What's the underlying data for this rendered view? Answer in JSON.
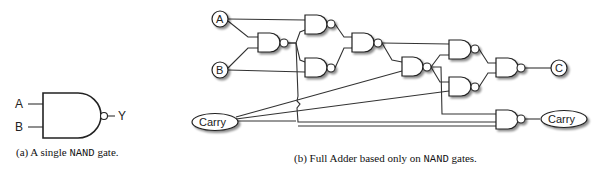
{
  "figure_a": {
    "inputs": [
      "A",
      "B"
    ],
    "output": "Y",
    "caption_prefix": "(a) A single ",
    "caption_code": "NAND",
    "caption_suffix": " gate."
  },
  "figure_b": {
    "inputs": {
      "a": "A",
      "b": "B",
      "carry_in": "Carry"
    },
    "outputs": {
      "sum": "C",
      "carry_out": "Carry"
    },
    "gate_count": 9,
    "gate_type": "NAND",
    "caption_prefix": "(b) Full Adder based only on ",
    "caption_code": "NAND",
    "caption_suffix": " gates."
  },
  "colors": {
    "stroke": "#222222",
    "background": "#ffffff"
  }
}
